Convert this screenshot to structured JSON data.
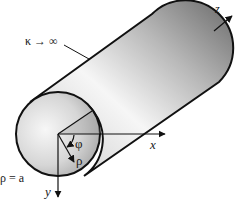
{
  "diagram": {
    "title": "",
    "labels": {
      "conductivity": "κ → ∞",
      "radius_condition": "ρ = a",
      "x_axis": "x",
      "y_axis": "y",
      "z_axis": "z",
      "phi": "φ",
      "rho": "ρ"
    },
    "colors": {
      "outline": "#111111",
      "shade_dark": "#7a7a7a",
      "shade_light": "#f4f4f4",
      "background": "#ffffff"
    }
  }
}
